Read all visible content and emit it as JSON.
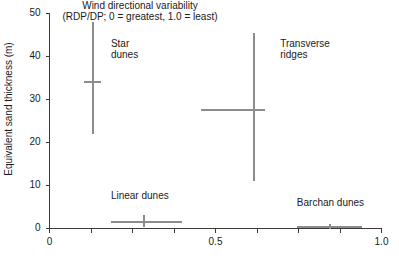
{
  "chart_data": {
    "type": "scatter",
    "title": "",
    "xlabel": "Wind directional variability",
    "xlabel_sub": "(RDP/DP; 0 = greatest, 1.0 = least)",
    "ylabel": "Equivalent sand thickness (m)",
    "xlim": [
      0,
      1.0
    ],
    "ylim": [
      0,
      50
    ],
    "xticks": [
      0,
      0.125,
      0.25,
      0.375,
      0.5,
      0.625,
      0.75,
      0.875,
      1.0
    ],
    "xtick_labels": [
      "0",
      "",
      "",
      "",
      "0.5",
      "",
      "",
      "",
      "1.0"
    ],
    "yticks": [
      0,
      10,
      20,
      30,
      40,
      50
    ],
    "ytick_labels": [
      "0",
      "10",
      "20",
      "30",
      "40",
      "50"
    ],
    "grid": false,
    "legend": "none",
    "series_color": "#8c8c8c",
    "axis_color": "#3a3a3a",
    "series": [
      {
        "name": "Star dunes",
        "label_lines": [
          "Star",
          "dunes"
        ],
        "x": 0.13,
        "y": 34,
        "x_low": 0.105,
        "x_high": 0.155,
        "y_low": 22,
        "y_high": 48,
        "label_x": 0.185,
        "label_y": 43
      },
      {
        "name": "Transverse ridges",
        "label_lines": [
          "Transverse",
          "ridges"
        ],
        "x": 0.615,
        "y": 27.5,
        "x_low": 0.455,
        "x_high": 0.65,
        "y_low": 11,
        "y_high": 45.5,
        "label_x": 0.695,
        "label_y": 43
      },
      {
        "name": "Linear dunes",
        "label_lines": [
          "Linear dunes"
        ],
        "x": 0.285,
        "y": 1.6,
        "x_low": 0.185,
        "x_high": 0.4,
        "y_low": 0.4,
        "y_high": 3.2,
        "label_x": 0.185,
        "label_y": 7.5
      },
      {
        "name": "Barchan dunes",
        "label_lines": [
          "Barchan dunes"
        ],
        "x": 0.845,
        "y": 0.35,
        "x_low": 0.745,
        "x_high": 0.94,
        "y_low": 0,
        "y_high": 1.0,
        "label_x": 0.745,
        "label_y": 6.0
      }
    ]
  }
}
